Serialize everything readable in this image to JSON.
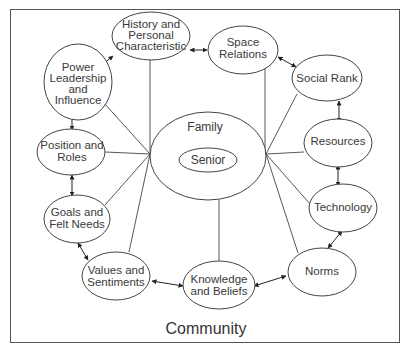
{
  "diagram": {
    "title": "Community",
    "center": {
      "outer_label": "Family",
      "inner_label": "Senior"
    },
    "nodes": [
      {
        "id": "history",
        "lines": [
          "History and",
          "Personal",
          "Characteristic"
        ]
      },
      {
        "id": "space",
        "lines": [
          "Space",
          "Relations"
        ]
      },
      {
        "id": "power",
        "lines": [
          "Power",
          "Leadership",
          "and",
          "Influence"
        ]
      },
      {
        "id": "social",
        "lines": [
          "Social Rank"
        ]
      },
      {
        "id": "position",
        "lines": [
          "Position and",
          "Roles"
        ]
      },
      {
        "id": "resources",
        "lines": [
          "Resources"
        ]
      },
      {
        "id": "goals",
        "lines": [
          "Goals and",
          "Felt Needs"
        ]
      },
      {
        "id": "technology",
        "lines": [
          "Technology"
        ]
      },
      {
        "id": "values",
        "lines": [
          "Values and",
          "Sentiments"
        ]
      },
      {
        "id": "knowledge",
        "lines": [
          "Knowledge",
          "and Beliefs"
        ]
      },
      {
        "id": "norms",
        "lines": [
          "Norms"
        ]
      }
    ],
    "edges_bidirectional": [
      [
        "power",
        "history"
      ],
      [
        "history",
        "space"
      ],
      [
        "space",
        "social"
      ],
      [
        "social",
        "resources"
      ],
      [
        "resources",
        "technology"
      ],
      [
        "technology",
        "norms"
      ],
      [
        "norms",
        "knowledge"
      ],
      [
        "knowledge",
        "values"
      ],
      [
        "values",
        "goals"
      ],
      [
        "goals",
        "position"
      ],
      [
        "position",
        "power"
      ]
    ],
    "edges_to_family": [
      "history",
      "power",
      "position",
      "goals",
      "values",
      "knowledge",
      "space",
      "social",
      "resources",
      "technology",
      "norms"
    ],
    "colors": {
      "stroke": "#444444",
      "text": "#3a3a3a",
      "background": "#ffffff",
      "frame": "#555555"
    }
  }
}
